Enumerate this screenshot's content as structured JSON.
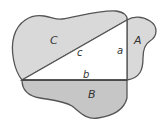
{
  "diagram": {
    "regions": [
      {
        "id": "C",
        "label": "C"
      },
      {
        "id": "A",
        "label": "A"
      },
      {
        "id": "B",
        "label": "B"
      }
    ],
    "triangle": {
      "sides": {
        "hypotenuse": "c",
        "vertical": "a",
        "horizontal": "b"
      }
    },
    "colors": {
      "fill_light": "#d9d9d9",
      "fill_dark": "#c6c6c6",
      "stroke": "#555555",
      "triangle_fill": "#ffffff"
    }
  }
}
